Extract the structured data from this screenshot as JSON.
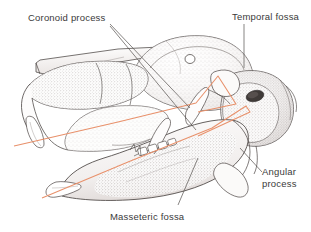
{
  "figure": {
    "background_color": "#ffffff",
    "ink_color": "#4a4442",
    "stipple_color": "#6b6360",
    "construction_line_color": "#e8906a",
    "leader_line_color": "#55504e",
    "label_text_color": "#3a3a3a"
  },
  "labels": {
    "coronoid": "Coronoid process",
    "temporal": "Temporal fossa",
    "angular_line1": "Angular",
    "angular_line2": "process",
    "masseteric": "Masseteric fossa"
  },
  "annotations": [
    {
      "name": "coronoid-process",
      "text": "Coronoid process",
      "leader_count": 2
    },
    {
      "name": "temporal-fossa",
      "text": "Temporal fossa",
      "leader_count": 1
    },
    {
      "name": "angular-process",
      "text": "Angular process",
      "leader_count": 1
    },
    {
      "name": "masseteric-fossa",
      "text": "Masseteric fossa",
      "leader_count": 1
    }
  ],
  "features": {
    "auditory_bulla_foramen": "dark-ellipse-opening",
    "orbital_foramen": "small-round-opening",
    "construction_lines": 2,
    "tooth_row_count": 4
  }
}
